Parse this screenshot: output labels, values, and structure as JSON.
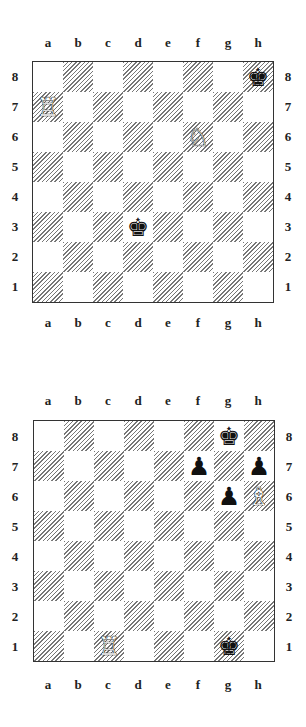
{
  "file_labels": [
    "a",
    "b",
    "c",
    "d",
    "e",
    "f",
    "g",
    "h"
  ],
  "rank_labels": [
    "8",
    "7",
    "6",
    "5",
    "4",
    "3",
    "2",
    "1"
  ],
  "diagrams": [
    {
      "name": "diagram-1",
      "pieces": [
        {
          "square": "h8",
          "color": "black",
          "type": "king",
          "glyph": "♚"
        },
        {
          "square": "a7",
          "color": "white",
          "type": "rook",
          "glyph": "♖"
        },
        {
          "square": "f6",
          "color": "white",
          "type": "knight",
          "glyph": "♘"
        },
        {
          "square": "d3",
          "color": "black",
          "type": "king",
          "glyph": "♚"
        }
      ]
    },
    {
      "name": "diagram-2",
      "pieces": [
        {
          "square": "g8",
          "color": "black",
          "type": "king",
          "glyph": "♚"
        },
        {
          "square": "f7",
          "color": "black",
          "type": "pawn",
          "glyph": "♟"
        },
        {
          "square": "h7",
          "color": "black",
          "type": "pawn",
          "glyph": "♟"
        },
        {
          "square": "g6",
          "color": "black",
          "type": "pawn",
          "glyph": "♟"
        },
        {
          "square": "h6",
          "color": "white",
          "type": "bishop",
          "glyph": "♗"
        },
        {
          "square": "c1",
          "color": "white",
          "type": "rook",
          "glyph": "♖"
        },
        {
          "square": "g1",
          "color": "black",
          "type": "king",
          "glyph": "♚"
        }
      ]
    }
  ]
}
